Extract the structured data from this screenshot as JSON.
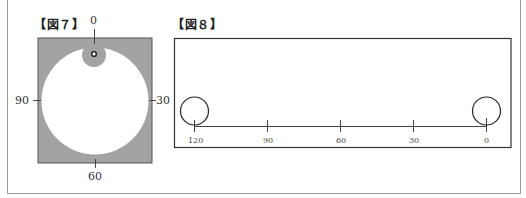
{
  "figure7": {
    "title": "【図７】",
    "labels": {
      "top": "0",
      "right": "30",
      "bottom": "60",
      "left": "90"
    },
    "colors": {
      "background": "#a3a3a3",
      "disc": "#ffffff",
      "spot": "#a3a3a3"
    }
  },
  "figure8": {
    "title": "【図８】",
    "scale_labels": [
      "120",
      "90",
      "60",
      "30",
      "0"
    ]
  }
}
